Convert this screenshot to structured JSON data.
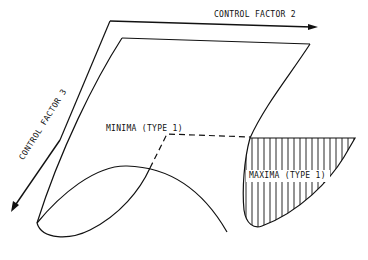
{
  "axes": {
    "factor2": "CONTROL FACTOR 2",
    "factor3": "CONTROL FACTOR 3"
  },
  "regions": {
    "minima": "MINIMA (TYPE 1)",
    "maxima": "MAXIMA (TYPE 1)"
  },
  "colors": {
    "line": "#111111",
    "background": "#ffffff"
  }
}
